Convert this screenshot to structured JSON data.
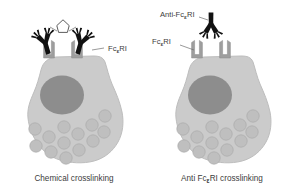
{
  "figure": {
    "background": "#ffffff",
    "width": 296,
    "height": 190
  },
  "colors": {
    "cell_body": "#cbcbcb",
    "cell_body_edge": "#bdbdbd",
    "nucleus": "#8d8d8d",
    "granule": "#bfbfbf",
    "granule_edge": "#ababab",
    "receptor": "#9e9e9e",
    "receptor_edge": "#8a8a8a",
    "antibody": "#111111",
    "crosslinker_edge": "#4a4a4a",
    "label_text": "#3c3c3c",
    "leader_line": "#6e6e6e"
  },
  "panels": [
    {
      "id": "left-panel",
      "caption": "Chemical crosslinking",
      "caption_parts": {
        "pre": "Chemical crosslinking",
        "sub": "",
        "post": ""
      },
      "labels": [
        {
          "id": "receptor-label-left",
          "pre": "Fc",
          "sub": "ε",
          "post": "RI"
        }
      ],
      "antibodies": 2,
      "crosslinker": "chemical-crosslinker",
      "receptors": 2,
      "granule_count": 13
    },
    {
      "id": "right-panel",
      "caption": "Anti FcεRI crosslinking",
      "caption_parts": {
        "pre": "Anti Fc",
        "sub": "ε",
        "post": "RI crosslinking"
      },
      "labels": [
        {
          "id": "antibody-label-right",
          "pre": "Anti-Fc",
          "sub": "ε",
          "post": "RI"
        },
        {
          "id": "receptor-label-right",
          "pre": "Fc",
          "sub": "ε",
          "post": "RI"
        }
      ],
      "antibodies": 1,
      "crosslinker": "none",
      "receptors": 2,
      "granule_count": 13
    }
  ],
  "icons": {
    "antibody": "antibody-y-shape-icon",
    "receptor": "fc-epsilon-ri-receptor-icon",
    "crosslinker": "chemical-crosslinker-icon",
    "nucleus": "cell-nucleus-icon",
    "granule": "cytoplasmic-granule-icon"
  }
}
